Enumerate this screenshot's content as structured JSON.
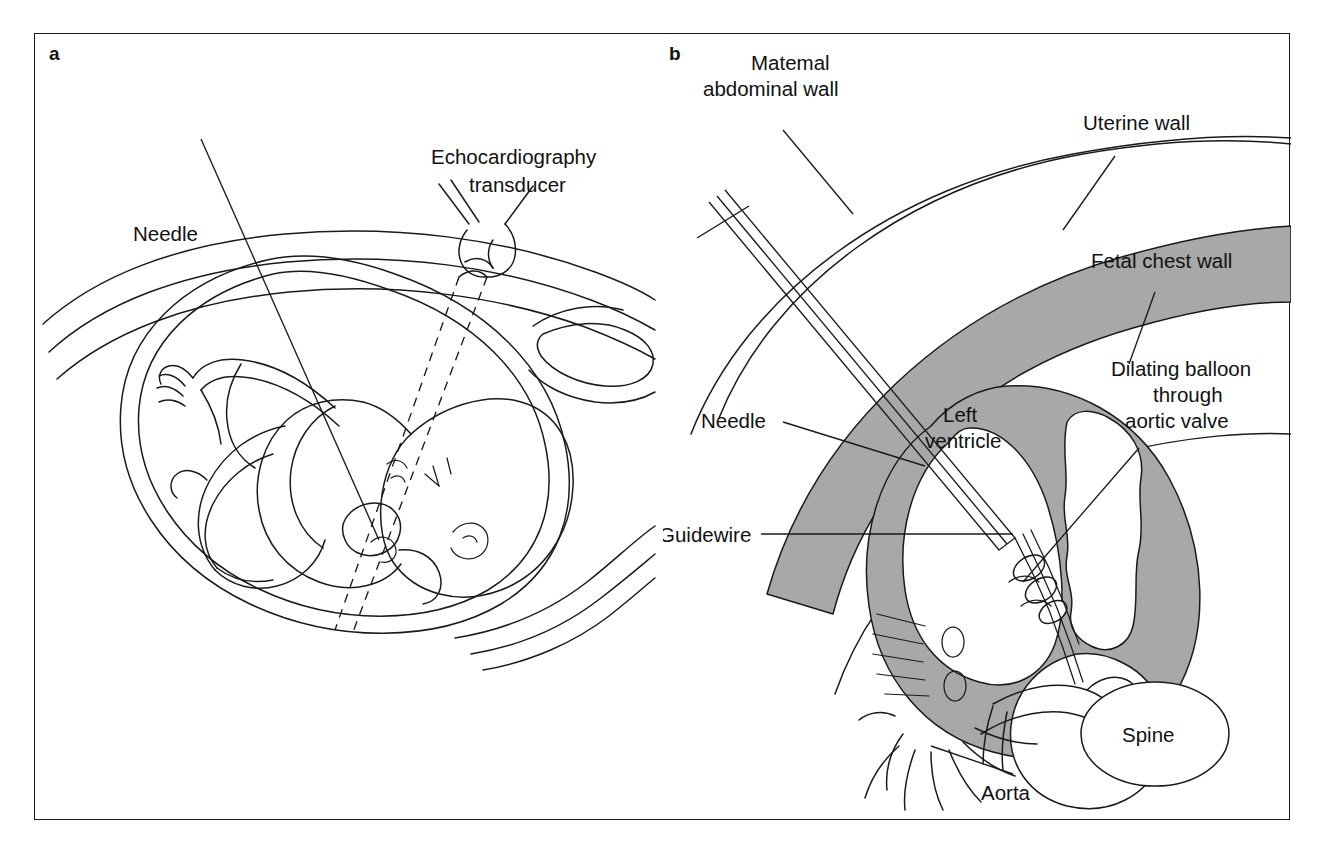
{
  "figure": {
    "panels": [
      {
        "letter": "a",
        "name": "fetal-ultrasound-guided-needle-panel",
        "labels": [
          {
            "id": "needle",
            "text": "Needle"
          },
          {
            "id": "transducer_line1",
            "text": "Echocardiography"
          },
          {
            "id": "transducer_line2",
            "text": "transducer"
          }
        ]
      },
      {
        "letter": "b",
        "name": "fetal-heart-balloon-valvuloplasty-panel",
        "labels": [
          {
            "id": "maternal_line1",
            "text": "Matemal"
          },
          {
            "id": "maternal_line2",
            "text": "abdominal wall"
          },
          {
            "id": "uterine_wall",
            "text": "Uterine wall"
          },
          {
            "id": "fetal_chest_wall",
            "text": "Fetal chest wall"
          },
          {
            "id": "needle",
            "text": "Needle"
          },
          {
            "id": "left_ventricle_line1",
            "text": "Left"
          },
          {
            "id": "left_ventricle_line2",
            "text": "ventricle"
          },
          {
            "id": "guidewire",
            "text": "Guidewire"
          },
          {
            "id": "balloon_line1",
            "text": "Dilating balloon"
          },
          {
            "id": "balloon_line2",
            "text": "through"
          },
          {
            "id": "balloon_line3",
            "text": "aortic valve"
          },
          {
            "id": "aorta",
            "text": "Aorta"
          },
          {
            "id": "spine",
            "text": "Spine"
          }
        ]
      }
    ],
    "colors": {
      "ink": "#1a1a1a",
      "tissue_shading": "#a8a8a8",
      "background": "#ffffff"
    }
  }
}
